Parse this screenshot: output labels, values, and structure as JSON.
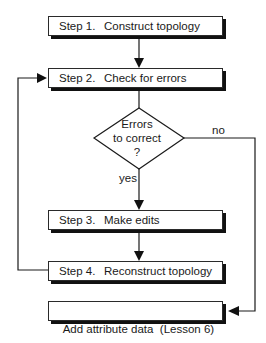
{
  "steps": [
    {
      "number": "Step 1.",
      "text": "Construct topology"
    },
    {
      "number": "Step 2.",
      "text": "Check for errors"
    },
    {
      "number": "Step 3.",
      "text": "Make edits"
    },
    {
      "number": "Step 4.",
      "text": "Reconstruct topology"
    }
  ],
  "decision": {
    "line1": "Errors",
    "line2": "to correct",
    "line3": "?",
    "yes_label": "yes",
    "no_label": "no"
  },
  "final_step": {
    "text": "Add attribute data  (Lesson 6)"
  },
  "colors": {
    "line": "#1a1a1a",
    "shadow": "#111111",
    "background": "#ffffff"
  }
}
